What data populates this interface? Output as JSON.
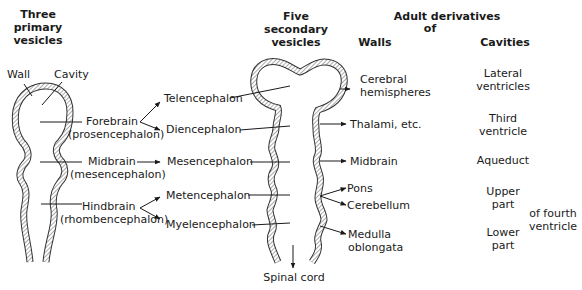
{
  "headers": {
    "primary": [
      "Three",
      "primary",
      "vesicles"
    ],
    "secondary": [
      "Five",
      "secondary",
      "vesicles"
    ],
    "adult": [
      "Adult derivatives",
      "of"
    ],
    "walls": "Walls",
    "cavities": "Cavities"
  },
  "wall_labels": {
    "wall": "Wall",
    "cavity": "Cavity"
  },
  "primary_vesicles": [
    {
      "name": "Forebrain",
      "alt": "(prosencephalon)"
    },
    {
      "name": "Midbrain",
      "alt": "(mesencephalon)"
    },
    {
      "name": "Hindbrain",
      "alt": "(rhombencephalon)"
    }
  ],
  "secondary_vesicles": [
    "Telencephalon",
    "Diencephalon",
    "Mesencephalon",
    "Metencephalon",
    "Myelencephalon"
  ],
  "walls": [
    "Cerebral",
    "hemispheres",
    "Thalami, etc.",
    "Midbrain",
    "Pons",
    "Cerebellum",
    "Medulla",
    "oblongata"
  ],
  "cavities": [
    "Lateral",
    "ventricles",
    "Third",
    "ventricle",
    "Aqueduct",
    "Upper",
    "part",
    "Lower",
    "part",
    "of fourth",
    "ventricle"
  ],
  "spinal_cord": "Spinal cord"
}
